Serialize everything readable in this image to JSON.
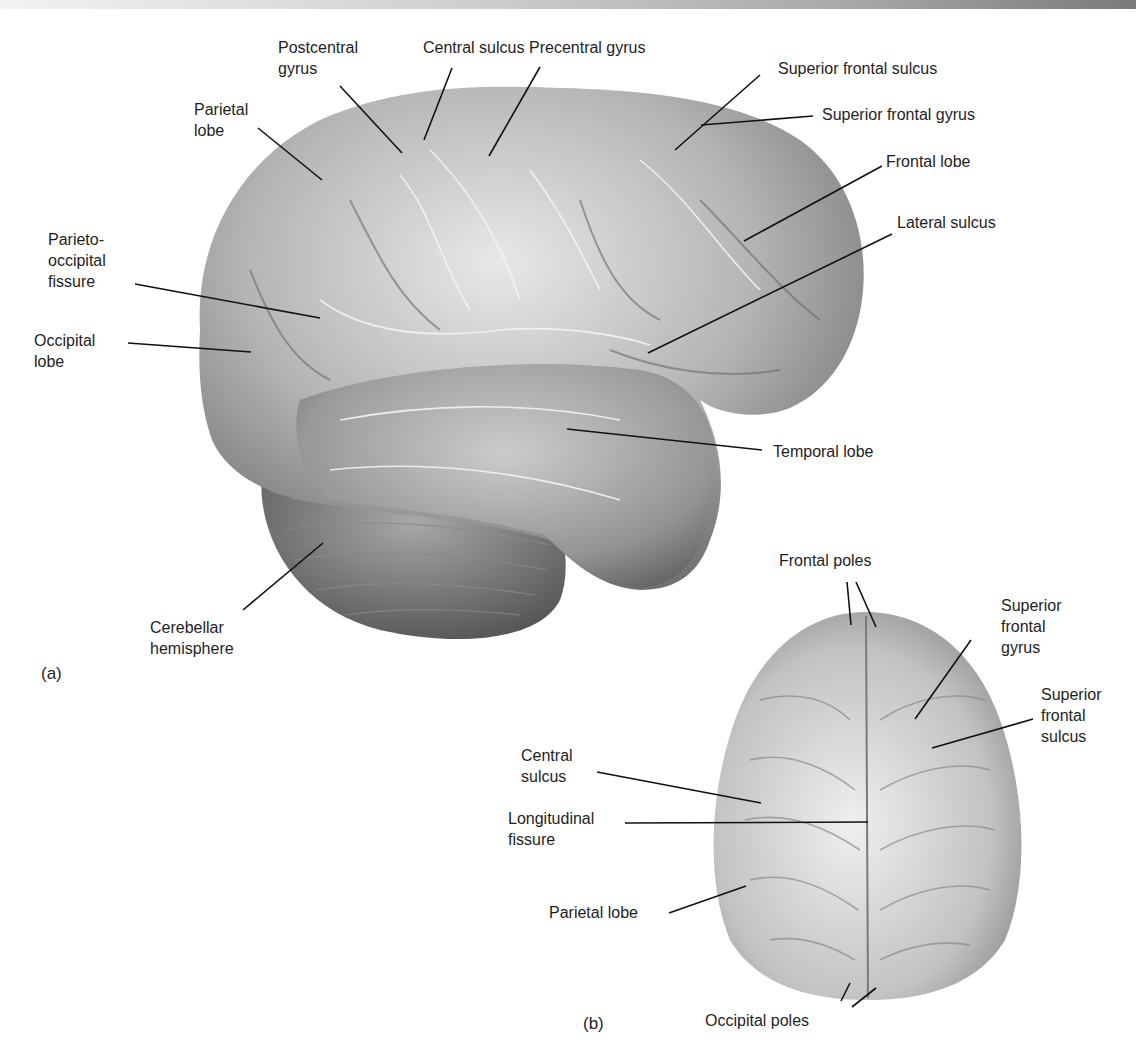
{
  "figure": {
    "panel_a": {
      "label": "(a)",
      "view": "lateral",
      "labels": [
        {
          "id": "postcentral-gyrus",
          "text": "Postcentral\ngyrus"
        },
        {
          "id": "central-sulcus",
          "text": "Central sulcus"
        },
        {
          "id": "precentral-gyrus",
          "text": "Precentral gyrus"
        },
        {
          "id": "superior-frontal-sulcus",
          "text": "Superior frontal sulcus"
        },
        {
          "id": "superior-frontal-gyrus",
          "text": "Superior frontal gyrus"
        },
        {
          "id": "parietal-lobe",
          "text": "Parietal\nlobe"
        },
        {
          "id": "frontal-lobe",
          "text": "Frontal lobe"
        },
        {
          "id": "lateral-sulcus",
          "text": "Lateral sulcus"
        },
        {
          "id": "parieto-occipital-fissure",
          "text": "Parieto-\noccipital\nfissure"
        },
        {
          "id": "occipital-lobe",
          "text": "Occipital\nlobe"
        },
        {
          "id": "temporal-lobe",
          "text": "Temporal lobe"
        },
        {
          "id": "cerebellar-hemisphere",
          "text": "Cerebellar\nhemisphere"
        }
      ]
    },
    "panel_b": {
      "label": "(b)",
      "view": "superior",
      "labels": [
        {
          "id": "frontal-poles",
          "text": "Frontal poles"
        },
        {
          "id": "superior-frontal-gyrus",
          "text": "Superior\nfrontal\ngyrus"
        },
        {
          "id": "superior-frontal-sulcus",
          "text": "Superior\nfrontal\nsulcus"
        },
        {
          "id": "central-sulcus",
          "text": "Central\nsulcus"
        },
        {
          "id": "longitudinal-fissure",
          "text": "Longitudinal\nfissure"
        },
        {
          "id": "parietal-lobe",
          "text": "Parietal lobe"
        },
        {
          "id": "occipital-poles",
          "text": "Occipital poles"
        }
      ]
    }
  }
}
